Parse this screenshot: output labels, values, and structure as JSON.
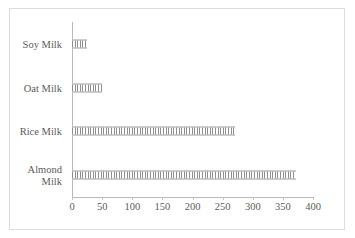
{
  "chart_data": {
    "type": "bar",
    "orientation": "horizontal",
    "title": "",
    "xlabel": "",
    "ylabel": "",
    "categories": [
      "Almond Milk",
      "Rice Milk",
      "Oat Milk",
      "Soy Milk"
    ],
    "values": [
      371,
      270,
      50,
      25
    ],
    "series": [
      {
        "name": "",
        "values": [
          371,
          270,
          50,
          25
        ]
      }
    ],
    "xlim": [
      0,
      400
    ],
    "xticks": [
      0,
      50,
      100,
      150,
      200,
      250,
      300,
      350,
      400
    ],
    "xtick_labels": [
      "0",
      "50",
      "100",
      "150",
      "200",
      "250",
      "300",
      "350",
      "400"
    ],
    "grid": false,
    "legend": false,
    "legend_position": "none",
    "bar_fill": "#e8e8e8",
    "bar_hatch": "vertical-stripes",
    "bar_edge_color": "#a8a8a8",
    "axis_color": "#b9b9b9",
    "text_color": "#5b5b5b",
    "background_color": "#ffffff",
    "frame_color": "#dcdcdc"
  },
  "category_labels": [
    {
      "line1": "Almond",
      "line2": "Milk",
      "two_line": true
    },
    {
      "line1": "Rice Milk",
      "line2": "",
      "two_line": false
    },
    {
      "line1": "Oat Milk",
      "line2": "",
      "two_line": false
    },
    {
      "line1": "Soy Milk",
      "line2": "",
      "two_line": false
    }
  ]
}
